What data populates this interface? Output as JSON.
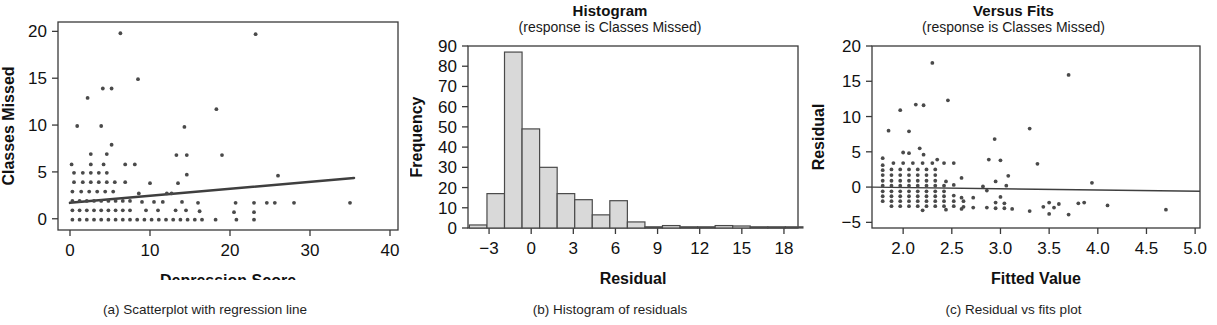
{
  "figure": {
    "panels": [
      {
        "id": "a",
        "title": "",
        "subtitle": "",
        "caption": "(a) Scatterplot with regression line",
        "xlabel": "Depression Score",
        "ylabel": "Classes Missed"
      },
      {
        "id": "b",
        "title": "Histogram",
        "subtitle": "(response is Classes Missed)",
        "caption": "(b) Histogram of residuals",
        "xlabel": "Residual",
        "ylabel": "Frequency"
      },
      {
        "id": "c",
        "title": "Versus Fits",
        "subtitle": "(response is Classes Missed)",
        "caption": "(c) Residual vs fits plot",
        "xlabel": "Fitted Value",
        "ylabel": "Residual"
      }
    ]
  },
  "colors": {
    "axis": "#3a3a3a",
    "point": "#4a4a4a",
    "bar_fill": "#d9d9d9",
    "bar_stroke": "#4a4a4a",
    "line": "#3f3f3f",
    "background": "#ffffff",
    "text": "#111111"
  },
  "chart_data": [
    {
      "type": "scatter",
      "panel": "a",
      "title": "",
      "subtitle": "",
      "caption": "(a) Scatterplot with regression line",
      "xlabel": "Depression Score",
      "ylabel": "Classes Missed",
      "xlim": [
        -1.5,
        41
      ],
      "ylim": [
        -1.2,
        21
      ],
      "xticks": [
        0,
        10,
        20,
        30,
        40
      ],
      "yticks": [
        0,
        5,
        10,
        15,
        20
      ],
      "xticklabels": [
        "0",
        "10",
        "20",
        "30",
        "40"
      ],
      "yticklabels": [
        "0",
        "5",
        "10",
        "15",
        "20"
      ],
      "grid": false,
      "legend": null,
      "regression_line": {
        "x": [
          0,
          35.5
        ],
        "y": [
          1.7,
          4.35
        ],
        "slope": 0.0746,
        "intercept": 1.7
      },
      "points": [
        [
          6.3,
          19.8
        ],
        [
          23.2,
          19.7
        ],
        [
          8.5,
          14.9
        ],
        [
          4.1,
          13.9
        ],
        [
          5.2,
          13.9
        ],
        [
          2.2,
          12.9
        ],
        [
          18.3,
          11.7
        ],
        [
          0.9,
          9.9
        ],
        [
          3.9,
          9.9
        ],
        [
          14.3,
          9.8
        ],
        [
          5.2,
          7.9
        ],
        [
          2.6,
          6.9
        ],
        [
          4.6,
          6.9
        ],
        [
          13.3,
          6.8
        ],
        [
          14.6,
          6.8
        ],
        [
          19.0,
          6.8
        ],
        [
          0.2,
          5.8
        ],
        [
          2.6,
          5.8
        ],
        [
          4.2,
          5.8
        ],
        [
          6.9,
          5.8
        ],
        [
          8.1,
          5.8
        ],
        [
          0.5,
          4.9
        ],
        [
          1.6,
          4.9
        ],
        [
          2.6,
          4.9
        ],
        [
          3.6,
          4.9
        ],
        [
          4.6,
          4.9
        ],
        [
          14.6,
          4.7
        ],
        [
          26.0,
          4.6
        ],
        [
          0.5,
          3.9
        ],
        [
          1.6,
          3.9
        ],
        [
          2.6,
          3.9
        ],
        [
          3.6,
          3.9
        ],
        [
          4.6,
          3.9
        ],
        [
          5.6,
          3.9
        ],
        [
          6.9,
          3.9
        ],
        [
          10.0,
          3.8
        ],
        [
          13.5,
          3.8
        ],
        [
          0.3,
          2.9
        ],
        [
          1.4,
          2.9
        ],
        [
          2.4,
          2.9
        ],
        [
          3.4,
          2.9
        ],
        [
          4.4,
          2.9
        ],
        [
          5.4,
          2.9
        ],
        [
          8.6,
          2.7
        ],
        [
          12.1,
          2.7
        ],
        [
          12.7,
          2.7
        ],
        [
          0.3,
          1.9
        ],
        [
          1.2,
          1.9
        ],
        [
          2.1,
          1.9
        ],
        [
          3.0,
          1.9
        ],
        [
          3.9,
          1.9
        ],
        [
          4.8,
          1.9
        ],
        [
          5.7,
          1.9
        ],
        [
          6.6,
          1.9
        ],
        [
          7.5,
          1.9
        ],
        [
          9.0,
          1.8
        ],
        [
          10.5,
          1.8
        ],
        [
          11.6,
          1.8
        ],
        [
          14.0,
          1.8
        ],
        [
          16.0,
          1.7
        ],
        [
          20.7,
          1.7
        ],
        [
          23.0,
          1.7
        ],
        [
          24.6,
          1.7
        ],
        [
          25.6,
          1.7
        ],
        [
          28.0,
          1.7
        ],
        [
          35.0,
          1.7
        ],
        [
          0.3,
          0.9
        ],
        [
          1.2,
          0.9
        ],
        [
          2.1,
          0.9
        ],
        [
          3.0,
          0.9
        ],
        [
          3.9,
          0.9
        ],
        [
          4.8,
          0.9
        ],
        [
          5.7,
          0.9
        ],
        [
          6.6,
          0.9
        ],
        [
          7.5,
          0.9
        ],
        [
          9.5,
          0.9
        ],
        [
          11.0,
          0.9
        ],
        [
          13.2,
          0.9
        ],
        [
          14.5,
          0.9
        ],
        [
          16.2,
          0.8
        ],
        [
          20.5,
          0.7
        ],
        [
          23.0,
          0.7
        ],
        [
          0.3,
          -0.1
        ],
        [
          1.2,
          -0.1
        ],
        [
          2.1,
          -0.1
        ],
        [
          3.0,
          -0.1
        ],
        [
          3.9,
          -0.1
        ],
        [
          4.8,
          -0.1
        ],
        [
          5.7,
          -0.1
        ],
        [
          6.6,
          -0.1
        ],
        [
          7.5,
          -0.1
        ],
        [
          8.4,
          -0.1
        ],
        [
          9.3,
          -0.1
        ],
        [
          10.2,
          -0.1
        ],
        [
          11.1,
          -0.1
        ],
        [
          12.0,
          -0.1
        ],
        [
          12.9,
          -0.1
        ],
        [
          13.8,
          -0.1
        ],
        [
          14.7,
          -0.1
        ],
        [
          15.6,
          -0.1
        ],
        [
          16.5,
          -0.1
        ],
        [
          18.2,
          -0.1
        ],
        [
          20.8,
          -0.1
        ],
        [
          23.0,
          -0.1
        ]
      ]
    },
    {
      "type": "bar",
      "panel": "b",
      "title": "Histogram",
      "subtitle": "(response is Classes Missed)",
      "caption": "(b) Histogram of residuals",
      "xlabel": "Residual",
      "ylabel": "Frequency",
      "xlim": [
        -4.5,
        19.0
      ],
      "ylim": [
        0,
        90
      ],
      "xticks": [
        -3,
        0,
        3,
        6,
        9,
        12,
        15,
        18
      ],
      "yticks": [
        0,
        10,
        20,
        30,
        40,
        50,
        60,
        70,
        80,
        90
      ],
      "xticklabels": [
        "−3",
        "0",
        "3",
        "6",
        "9",
        "12",
        "15",
        "18"
      ],
      "yticklabels": [
        "0",
        "10",
        "20",
        "30",
        "40",
        "50",
        "60",
        "70",
        "80",
        "90"
      ],
      "grid": false,
      "legend": null,
      "bin_width": 1.25,
      "bin_starts": [
        -4.4,
        -3.15,
        -1.9,
        -0.65,
        0.6,
        1.85,
        3.1,
        4.35,
        5.6,
        6.85,
        8.1,
        9.35,
        10.6,
        11.85,
        13.1,
        14.35,
        15.6,
        16.85,
        18.1
      ],
      "values": [
        1.5,
        17,
        87,
        49,
        30,
        17,
        14,
        6.5,
        13.5,
        3,
        0.5,
        1.2,
        0.4,
        0.3,
        1.2,
        1.0,
        0.2,
        0.5,
        0.4
      ]
    },
    {
      "type": "scatter",
      "panel": "c",
      "title": "Versus Fits",
      "subtitle": "(response is Classes Missed)",
      "caption": "(c) Residual vs fits plot",
      "xlabel": "Fitted Value",
      "ylabel": "Residual",
      "xlim": [
        1.68,
        5.05
      ],
      "ylim": [
        -5.8,
        20
      ],
      "xticks": [
        2.0,
        2.5,
        3.0,
        3.5,
        4.0,
        4.5,
        5.0
      ],
      "yticks": [
        -5,
        0,
        5,
        10,
        15,
        20
      ],
      "xticklabels": [
        "2.0",
        "2.5",
        "3.0",
        "3.5",
        "4.0",
        "4.5",
        "5.0"
      ],
      "yticklabels": [
        "−5",
        "0",
        "5",
        "10",
        "15",
        "20"
      ],
      "grid": false,
      "legend": null,
      "reference_line": {
        "y0": 0.0,
        "y1": -0.6,
        "x": [
          1.68,
          5.05
        ]
      },
      "points": [
        [
          2.3,
          17.6
        ],
        [
          3.7,
          15.9
        ],
        [
          2.46,
          12.3
        ],
        [
          2.13,
          11.7
        ],
        [
          2.21,
          11.6
        ],
        [
          1.97,
          10.9
        ],
        [
          1.85,
          8.0
        ],
        [
          2.06,
          7.9
        ],
        [
          3.3,
          8.3
        ],
        [
          2.94,
          6.8
        ],
        [
          2.17,
          5.5
        ],
        [
          1.79,
          4.1
        ],
        [
          2.0,
          4.9
        ],
        [
          2.06,
          4.8
        ],
        [
          2.21,
          4.6
        ],
        [
          2.35,
          3.9
        ],
        [
          2.42,
          3.4
        ],
        [
          2.52,
          3.4
        ],
        [
          2.88,
          3.9
        ],
        [
          3.0,
          3.8
        ],
        [
          3.38,
          3.3
        ],
        [
          1.79,
          3.1
        ],
        [
          1.9,
          3.4
        ],
        [
          2.0,
          3.4
        ],
        [
          2.1,
          3.4
        ],
        [
          2.2,
          3.4
        ],
        [
          2.3,
          3.4
        ],
        [
          1.79,
          2.4
        ],
        [
          1.88,
          2.5
        ],
        [
          1.97,
          2.5
        ],
        [
          2.06,
          2.5
        ],
        [
          2.15,
          2.5
        ],
        [
          2.24,
          2.5
        ],
        [
          2.33,
          2.5
        ],
        [
          1.79,
          1.7
        ],
        [
          1.88,
          1.7
        ],
        [
          1.97,
          1.7
        ],
        [
          2.06,
          1.7
        ],
        [
          2.15,
          1.7
        ],
        [
          2.24,
          1.7
        ],
        [
          2.33,
          1.7
        ],
        [
          2.6,
          1.3
        ],
        [
          3.08,
          1.6
        ],
        [
          1.79,
          0.9
        ],
        [
          1.88,
          0.9
        ],
        [
          1.97,
          0.9
        ],
        [
          2.06,
          0.9
        ],
        [
          2.15,
          0.9
        ],
        [
          2.24,
          0.9
        ],
        [
          2.33,
          0.9
        ],
        [
          2.44,
          0.8
        ],
        [
          2.95,
          0.8
        ],
        [
          3.94,
          0.6
        ],
        [
          1.79,
          0.2
        ],
        [
          1.88,
          0.2
        ],
        [
          1.97,
          0.2
        ],
        [
          2.06,
          0.2
        ],
        [
          2.15,
          0.2
        ],
        [
          2.24,
          0.2
        ],
        [
          2.33,
          0.2
        ],
        [
          2.42,
          0.2
        ],
        [
          2.52,
          0.3
        ],
        [
          2.82,
          0.1
        ],
        [
          3.06,
          0.2
        ],
        [
          1.79,
          -0.6
        ],
        [
          1.88,
          -0.6
        ],
        [
          1.97,
          -0.6
        ],
        [
          2.06,
          -0.6
        ],
        [
          2.15,
          -0.6
        ],
        [
          2.24,
          -0.6
        ],
        [
          2.33,
          -0.6
        ],
        [
          2.42,
          -0.6
        ],
        [
          2.86,
          -0.5
        ],
        [
          1.79,
          -1.3
        ],
        [
          1.88,
          -1.3
        ],
        [
          1.97,
          -1.3
        ],
        [
          2.06,
          -1.3
        ],
        [
          2.15,
          -1.3
        ],
        [
          2.24,
          -1.3
        ],
        [
          2.33,
          -1.3
        ],
        [
          2.42,
          -1.3
        ],
        [
          2.52,
          -1.2
        ],
        [
          2.6,
          -1.5
        ],
        [
          2.72,
          -1.5
        ],
        [
          3.0,
          -1.4
        ],
        [
          1.79,
          -2.0
        ],
        [
          1.88,
          -2.0
        ],
        [
          1.97,
          -2.0
        ],
        [
          2.06,
          -2.0
        ],
        [
          2.15,
          -2.0
        ],
        [
          2.24,
          -2.0
        ],
        [
          2.33,
          -2.0
        ],
        [
          2.42,
          -2.0
        ],
        [
          2.52,
          -2.0
        ],
        [
          2.62,
          -2.0
        ],
        [
          2.95,
          -2.2
        ],
        [
          3.04,
          -2.3
        ],
        [
          3.5,
          -2.2
        ],
        [
          3.8,
          -2.3
        ],
        [
          3.86,
          -2.2
        ],
        [
          3.6,
          -2.4
        ],
        [
          1.88,
          -2.7
        ],
        [
          1.97,
          -2.7
        ],
        [
          2.06,
          -2.7
        ],
        [
          2.15,
          -2.7
        ],
        [
          2.24,
          -2.7
        ],
        [
          2.33,
          -2.7
        ],
        [
          2.42,
          -2.7
        ],
        [
          2.52,
          -2.7
        ],
        [
          2.62,
          -2.8
        ],
        [
          2.72,
          -2.9
        ],
        [
          2.86,
          -2.9
        ],
        [
          2.95,
          -3.0
        ],
        [
          3.04,
          -3.0
        ],
        [
          3.12,
          -3.1
        ],
        [
          3.3,
          -3.4
        ],
        [
          3.44,
          -2.8
        ],
        [
          3.55,
          -2.9
        ],
        [
          4.1,
          -2.6
        ],
        [
          4.7,
          -3.2
        ],
        [
          3.5,
          -3.8
        ],
        [
          3.7,
          -3.9
        ],
        [
          2.2,
          -3.3
        ],
        [
          2.44,
          -3.2
        ],
        [
          2.6,
          -3.1
        ]
      ]
    }
  ]
}
